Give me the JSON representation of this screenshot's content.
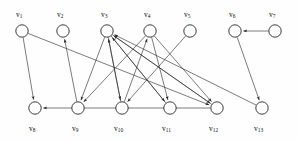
{
  "figure": {
    "type": "directed-graph",
    "background": "#fefefe",
    "node_fill": "#ffffff",
    "node_stroke": "#1a1a1a",
    "edge_color": "#2a2a2a",
    "label_color": "#111111",
    "node_radius": 6.2
  },
  "nodes": [
    {
      "id": "v1",
      "label": "v",
      "sub": "1",
      "x": 22,
      "y": 31,
      "label_x": 16,
      "label_y": 10,
      "row": "top"
    },
    {
      "id": "v2",
      "label": "v",
      "sub": "2",
      "x": 63,
      "y": 31,
      "label_x": 57,
      "label_y": 10,
      "row": "top"
    },
    {
      "id": "v3",
      "label": "v",
      "sub": "3",
      "x": 107,
      "y": 31,
      "label_x": 101,
      "label_y": 10,
      "row": "top"
    },
    {
      "id": "v4",
      "label": "v",
      "sub": "4",
      "x": 150,
      "y": 31,
      "label_x": 144,
      "label_y": 10,
      "row": "top"
    },
    {
      "id": "v5",
      "label": "v",
      "sub": "5",
      "x": 190,
      "y": 31,
      "label_x": 184,
      "label_y": 10,
      "row": "top"
    },
    {
      "id": "v6",
      "label": "v",
      "sub": "6",
      "x": 235,
      "y": 31,
      "label_x": 229,
      "label_y": 10,
      "row": "top"
    },
    {
      "id": "v7",
      "label": "v",
      "sub": "7",
      "x": 275,
      "y": 31,
      "label_x": 269,
      "label_y": 10,
      "row": "top"
    },
    {
      "id": "v8",
      "label": "v",
      "sub": "8",
      "x": 35,
      "y": 108,
      "label_x": 29,
      "label_y": 124,
      "row": "bottom"
    },
    {
      "id": "v9",
      "label": "v",
      "sub": "9",
      "x": 78,
      "y": 108,
      "label_x": 72,
      "label_y": 124,
      "row": "bottom"
    },
    {
      "id": "v10",
      "label": "v",
      "sub": "10",
      "x": 122,
      "y": 108,
      "label_x": 114,
      "label_y": 124,
      "row": "bottom"
    },
    {
      "id": "v11",
      "label": "v",
      "sub": "11",
      "x": 170,
      "y": 108,
      "label_x": 162,
      "label_y": 124,
      "row": "bottom"
    },
    {
      "id": "v12",
      "label": "v",
      "sub": "12",
      "x": 217,
      "y": 108,
      "label_x": 209,
      "label_y": 124,
      "row": "bottom"
    },
    {
      "id": "v13",
      "label": "v",
      "sub": "13",
      "x": 262,
      "y": 108,
      "label_x": 254,
      "label_y": 124,
      "row": "bottom"
    }
  ],
  "edges": [
    {
      "from": "v1",
      "to": "v8",
      "directed": true
    },
    {
      "from": "v1",
      "to": "v12",
      "directed": true
    },
    {
      "from": "v9",
      "to": "v2",
      "directed": true
    },
    {
      "from": "v3",
      "to": "v9",
      "directed": true
    },
    {
      "from": "v3",
      "to": "v10",
      "directed": true
    },
    {
      "from": "v3",
      "to": "v11",
      "directed": true
    },
    {
      "from": "v3",
      "to": "v12",
      "directed": true
    },
    {
      "from": "v10",
      "to": "v3",
      "directed": true
    },
    {
      "from": "v11",
      "to": "v3",
      "directed": true
    },
    {
      "from": "v12",
      "to": "v3",
      "directed": true
    },
    {
      "from": "v13",
      "to": "v3",
      "directed": true
    },
    {
      "from": "v4",
      "to": "v9",
      "directed": true
    },
    {
      "from": "v4",
      "to": "v11",
      "directed": true
    },
    {
      "from": "v4",
      "to": "v12",
      "directed": true
    },
    {
      "from": "v10",
      "to": "v4",
      "directed": true
    },
    {
      "from": "v5",
      "to": "v10",
      "directed": true
    },
    {
      "from": "v7",
      "to": "v6",
      "directed": true
    },
    {
      "from": "v6",
      "to": "v13",
      "directed": true
    },
    {
      "from": "v12",
      "to": "v8",
      "directed": true
    }
  ]
}
